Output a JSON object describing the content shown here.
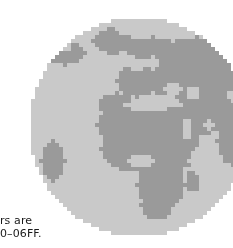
{
  "figure": {
    "name": "pixelated-earth-globe",
    "ocean_color": "#c9c9c9",
    "land_color": "#9a9a9a",
    "background_color": "#ffffff",
    "pixel_size": 4,
    "center_x": 139,
    "center_y": 127,
    "radius": 110,
    "landmasses": [
      "Europe",
      "Africa",
      "Middle East",
      "Greenland",
      "Asia",
      "South America edge"
    ]
  },
  "caption": {
    "line1": "rs are",
    "line2": "0–06FF."
  },
  "chart_data": {
    "type": "heatmap",
    "title": "",
    "xlabel": "",
    "ylabel": "",
    "grid_cols": 56,
    "grid_rows": 56,
    "cell_px": 4,
    "origin_x": 27,
    "origin_y": 15,
    "palette": {
      "0": "#ffffff",
      "1": "#c9c9c9",
      "2": "#9a9a9a"
    },
    "legend": [
      {
        "value": 0,
        "label": "background",
        "color": "#ffffff"
      },
      {
        "value": 1,
        "label": "ocean",
        "color": "#c9c9c9"
      },
      {
        "value": 2,
        "label": "land",
        "color": "#9a9a9a"
      }
    ],
    "land_regions": [
      {
        "name": "greenland",
        "cx": 21,
        "cy": 6,
        "rx": 5.0,
        "ry": 3.2
      },
      {
        "name": "north-atlantic-canada",
        "cx": 9,
        "cy": 9,
        "rx": 5.0,
        "ry": 3.0
      },
      {
        "name": "scandinavia",
        "cx": 31,
        "cy": 8,
        "rx": 6.5,
        "ry": 3.0
      },
      {
        "name": "russia-north",
        "cx": 42,
        "cy": 9,
        "rx": 9.0,
        "ry": 4.0
      },
      {
        "name": "siberia",
        "cx": 47,
        "cy": 14,
        "rx": 8.0,
        "ry": 5.0
      },
      {
        "name": "west-europe",
        "cx": 27,
        "cy": 16,
        "rx": 5.0,
        "ry": 4.0
      },
      {
        "name": "east-europe",
        "cx": 34,
        "cy": 15,
        "rx": 6.0,
        "ry": 4.5
      },
      {
        "name": "central-asia",
        "cx": 43,
        "cy": 18,
        "rx": 7.0,
        "ry": 5.0
      },
      {
        "name": "iberia-nw-africa",
        "cx": 22,
        "cy": 22,
        "rx": 4.5,
        "ry": 3.0
      },
      {
        "name": "north-africa",
        "cx": 27,
        "cy": 27,
        "rx": 10.0,
        "ry": 5.0
      },
      {
        "name": "sahara-east",
        "cx": 36,
        "cy": 27,
        "rx": 7.0,
        "ry": 5.0
      },
      {
        "name": "arabia",
        "cx": 42,
        "cy": 26,
        "rx": 5.0,
        "ry": 4.0
      },
      {
        "name": "west-africa",
        "cx": 25,
        "cy": 33,
        "rx": 7.0,
        "ry": 5.5
      },
      {
        "name": "central-africa",
        "cx": 32,
        "cy": 34,
        "rx": 7.0,
        "ry": 6.0
      },
      {
        "name": "east-africa",
        "cx": 38,
        "cy": 33,
        "rx": 4.5,
        "ry": 5.0
      },
      {
        "name": "southern-africa",
        "cx": 33,
        "cy": 42,
        "rx": 6.0,
        "ry": 6.5
      },
      {
        "name": "south-africa-tip",
        "cx": 32,
        "cy": 47,
        "rx": 4.0,
        "ry": 3.5
      },
      {
        "name": "india-east",
        "cx": 49,
        "cy": 25,
        "rx": 4.0,
        "ry": 4.5
      },
      {
        "name": "asia-far-east",
        "cx": 51,
        "cy": 31,
        "rx": 4.0,
        "ry": 6.0
      },
      {
        "name": "south-america-edge",
        "cx": 6,
        "cy": 36,
        "rx": 3.0,
        "ry": 5.0
      },
      {
        "name": "madagascar",
        "cx": 41,
        "cy": 41,
        "rx": 1.6,
        "ry": 2.6
      }
    ],
    "ocean_cutouts": [
      {
        "name": "mediterranean",
        "cx": 30,
        "cy": 22,
        "rx": 6.0,
        "ry": 1.8
      },
      {
        "name": "black-sea",
        "cx": 36,
        "cy": 18,
        "rx": 2.4,
        "ry": 1.2
      },
      {
        "name": "red-sea",
        "cx": 39.5,
        "cy": 28,
        "rx": 1.2,
        "ry": 3.0
      },
      {
        "name": "persian-gulf",
        "cx": 45,
        "cy": 27,
        "rx": 1.8,
        "ry": 1.2
      },
      {
        "name": "baltic",
        "cx": 31,
        "cy": 11.5,
        "rx": 2.0,
        "ry": 1.6
      },
      {
        "name": "north-sea",
        "cx": 27,
        "cy": 12,
        "rx": 1.8,
        "ry": 1.4
      },
      {
        "name": "gulf-of-guinea",
        "cx": 28,
        "cy": 36,
        "rx": 3.0,
        "ry": 1.6
      },
      {
        "name": "caspian",
        "cx": 41,
        "cy": 19,
        "rx": 1.4,
        "ry": 1.8
      },
      {
        "name": "hudson-bay",
        "cx": 9,
        "cy": 7,
        "rx": 1.6,
        "ry": 1.4
      },
      {
        "name": "indian-ocean-gap",
        "cx": 44,
        "cy": 36,
        "rx": 4.0,
        "ry": 4.0
      },
      {
        "name": "arctic-gap",
        "cx": 26,
        "cy": 3,
        "rx": 4.0,
        "ry": 1.6
      }
    ]
  }
}
